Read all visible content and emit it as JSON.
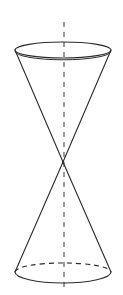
{
  "figure": {
    "name": "double-cone",
    "title": "Double cone (two nappes) with vertical axis of symmetry",
    "canvas": {
      "width": 123,
      "height": 295,
      "background": "#ffffff"
    },
    "colors": {
      "outline": "#2b2b2b",
      "hidden_edge": "#2b2b2b",
      "axis": "#8a8a8a",
      "background": "#ffffff"
    },
    "stroke": {
      "outline_width": 1.1,
      "hidden_width": 1.1,
      "axis_width": 1.6,
      "axis_dash": "5 5",
      "hidden_dash": "5 4"
    },
    "geometry": {
      "apex": {
        "x": 63,
        "y": 162
      },
      "axis": {
        "x": 64,
        "y_top": 22,
        "y_bottom": 287
      },
      "top_base": {
        "label": "upper-nappe-base-ellipse",
        "cx": 63,
        "cy": 50,
        "rx": 48,
        "ry": 8,
        "hidden_arc_visible": false
      },
      "bottom_base": {
        "label": "lower-nappe-base-ellipse",
        "cx": 63,
        "cy": 272,
        "rx": 48,
        "ry": 9,
        "hidden_arc_visible": true
      },
      "slant_left_top": {
        "x1": 15,
        "y1": 50,
        "x2": 63,
        "y2": 162
      },
      "slant_right_top": {
        "x1": 111,
        "y1": 50,
        "x2": 63,
        "y2": 162
      },
      "slant_left_bottom": {
        "x1": 63,
        "y1": 162,
        "x2": 15,
        "y2": 272
      },
      "slant_right_bottom": {
        "x1": 63,
        "y1": 162,
        "x2": 111,
        "y2": 272
      }
    },
    "parts": {
      "upper_nappe": "upper cone (opening upward)",
      "lower_nappe": "lower cone (opening downward)",
      "axis_label": "axis of symmetry",
      "apex_label": "common vertex"
    }
  }
}
